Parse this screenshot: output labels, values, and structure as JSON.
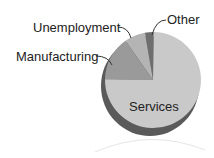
{
  "chart_data": {
    "type": "pie",
    "title": "",
    "categories": [
      "Services",
      "Manufacturing",
      "Unemployment",
      "Other"
    ],
    "values": [
      75,
      15,
      7,
      3
    ],
    "colors": [
      "#c9c9c9",
      "#9a9a9a",
      "#b4b4b4",
      "#6e6e6e"
    ],
    "legend": "none (callout labels)",
    "labels": {
      "services": "Services",
      "manufacturing": "Manufacturing",
      "unemployment": "Unemployment",
      "other": "Other"
    }
  }
}
